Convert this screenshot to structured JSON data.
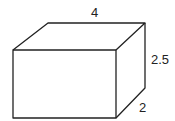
{
  "diagram": {
    "type": "rectangular-prism",
    "labels": {
      "length": "4",
      "height": "2.5",
      "depth": "2"
    },
    "stroke_color": "#222222"
  }
}
